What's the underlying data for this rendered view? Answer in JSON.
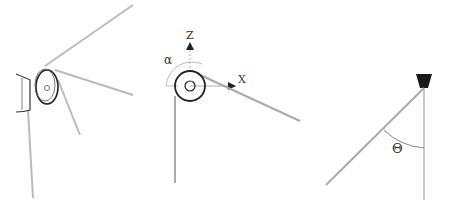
{
  "panels": [
    {
      "id": "pulley-perspective",
      "description": "Pulley with bracket and cables, perspective view"
    },
    {
      "id": "pulley-axes",
      "description": "Pulley front view with axes and angle alpha",
      "labels": {
        "z_axis": "Z",
        "x_axis": "X",
        "angle": "α"
      }
    },
    {
      "id": "cable-anchor",
      "description": "Cable from anchor with angle theta to vertical",
      "labels": {
        "angle": "Θ"
      }
    }
  ],
  "colors": {
    "cable": "#b0b0b0",
    "line": "#222222",
    "anchor": "#1a1a1a"
  }
}
